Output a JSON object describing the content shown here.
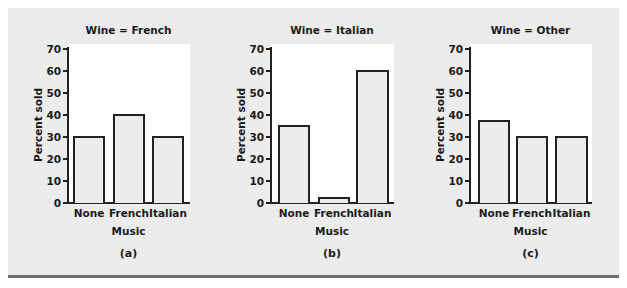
{
  "chart_data": [
    {
      "type": "bar",
      "title": "Wine = French",
      "categories": [
        "None",
        "French",
        "Italian"
      ],
      "values": [
        30,
        40,
        30
      ],
      "xlabel": "Music",
      "ylabel": "Percent sold",
      "ylim": [
        0,
        70
      ],
      "yticks": [
        0,
        10,
        20,
        30,
        40,
        50,
        60,
        70
      ],
      "caption": "(a)"
    },
    {
      "type": "bar",
      "title": "Wine = Italian",
      "categories": [
        "None",
        "French",
        "Italian"
      ],
      "values": [
        35,
        2.5,
        60
      ],
      "xlabel": "Music",
      "ylabel": "Percent sold",
      "ylim": [
        0,
        70
      ],
      "yticks": [
        0,
        10,
        20,
        30,
        40,
        50,
        60,
        70
      ],
      "caption": "(b)"
    },
    {
      "type": "bar",
      "title": "Wine = Other",
      "categories": [
        "None",
        "French",
        "Italian"
      ],
      "values": [
        37.5,
        30,
        30
      ],
      "xlabel": "Music",
      "ylabel": "Percent sold",
      "ylim": [
        0,
        70
      ],
      "yticks": [
        0,
        10,
        20,
        30,
        40,
        50,
        60,
        70
      ],
      "caption": "(c)"
    }
  ],
  "colors": {
    "frame": "#ececec",
    "plot_bg": "#ffffff",
    "bar_fill": "#ececec",
    "bar_edge": "#222222",
    "rule": "#6e6e6e"
  }
}
